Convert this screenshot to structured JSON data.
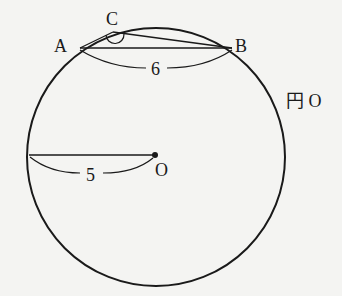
{
  "diagram": {
    "type": "geometry",
    "circle": {
      "label": "円 O",
      "cx": 156,
      "cy": 157,
      "r": 129
    },
    "points": {
      "A": {
        "label": "A",
        "x": 80,
        "y": 48
      },
      "B": {
        "label": "B",
        "x": 232,
        "y": 48
      },
      "C": {
        "label": "C",
        "x": 112,
        "y": 30
      },
      "O": {
        "label": "O",
        "x": 155,
        "y": 155
      }
    },
    "segments": [
      {
        "from": "A",
        "to": "B"
      },
      {
        "from": "A",
        "to": "C"
      },
      {
        "from": "C",
        "to": "B"
      },
      {
        "from": "O",
        "to": "left-edge"
      }
    ],
    "measurements": {
      "AB": "6",
      "radius": "5"
    },
    "angle_mark": "C"
  }
}
